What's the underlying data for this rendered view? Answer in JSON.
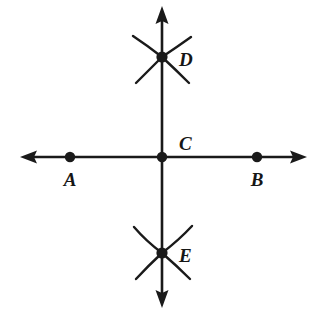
{
  "figure": {
    "background_color": "#ffffff",
    "stroke_color": "#1a1a1a",
    "width": 316,
    "height": 315
  },
  "lines": [
    {
      "name": "horizontal-line-AB",
      "orientation": "horizontal",
      "x1": 27,
      "y1": 157,
      "x2": 300,
      "y2": 157,
      "arrow_start": true,
      "arrow_end": true
    },
    {
      "name": "vertical-line-DE",
      "orientation": "vertical",
      "x1": 162,
      "y1": 13,
      "x2": 162,
      "y2": 301,
      "arrow_start": true,
      "arrow_end": true
    }
  ],
  "points": [
    {
      "id": "A",
      "label": "A",
      "x": 70,
      "y": 157,
      "label_x": 70,
      "label_y": 186,
      "label_anchor": "middle"
    },
    {
      "id": "B",
      "label": "B",
      "x": 257,
      "y": 157,
      "label_x": 257,
      "label_y": 186,
      "label_anchor": "middle"
    },
    {
      "id": "C",
      "label": "C",
      "x": 162,
      "y": 157,
      "label_x": 179,
      "label_y": 150,
      "label_anchor": "start"
    },
    {
      "id": "D",
      "label": "D",
      "x": 162,
      "y": 57,
      "label_x": 179,
      "label_y": 66,
      "label_anchor": "start"
    },
    {
      "id": "E",
      "label": "E",
      "x": 162,
      "y": 253,
      "label_x": 179,
      "label_y": 262,
      "label_anchor": "start"
    }
  ],
  "arc_marks": [
    {
      "name": "arc-mark-D",
      "at_point": "D",
      "description": "four compass arcs crossing at D",
      "strokes": [
        "M 133 36 Q 148 46 162 57",
        "M 191 37 Q 177 47 162 57",
        "M 136 83 Q 149 70 162 57",
        "M 189 83 Q 176 70 162 57"
      ]
    },
    {
      "name": "arc-mark-E",
      "at_point": "E",
      "description": "four compass arcs crossing at E",
      "strokes": [
        "M 134 227 Q 146 241 162 253",
        "M 192 226 Q 179 240 162 253",
        "M 136 279 Q 148 266 162 253",
        "M 190 279 Q 177 266 162 253"
      ]
    }
  ],
  "dot_radius": 5.2,
  "line_width": 2.6,
  "arc_width": 2.4
}
